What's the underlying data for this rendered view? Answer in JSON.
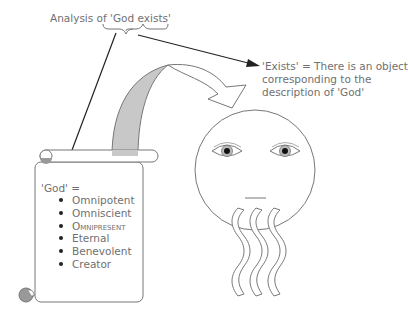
{
  "title": "Analysis of 'God exists'",
  "exists_definition": {
    "line1": "'Exists' = There is an object",
    "line2": "corresponding to the",
    "line3": "description of 'God'"
  },
  "scroll": {
    "heading": "'God' =",
    "attributes": [
      {
        "label": "Omnipotent"
      },
      {
        "label": "Omniscient"
      },
      {
        "label": "Omnipresent",
        "style": "small-caps"
      },
      {
        "label": "Eternal"
      },
      {
        "label": "Benevolent"
      },
      {
        "label": "Creator"
      }
    ]
  },
  "colors": {
    "line": "#222222",
    "outline": "#777777",
    "fill_gray": "#c8c8c8",
    "text": "#707070"
  }
}
